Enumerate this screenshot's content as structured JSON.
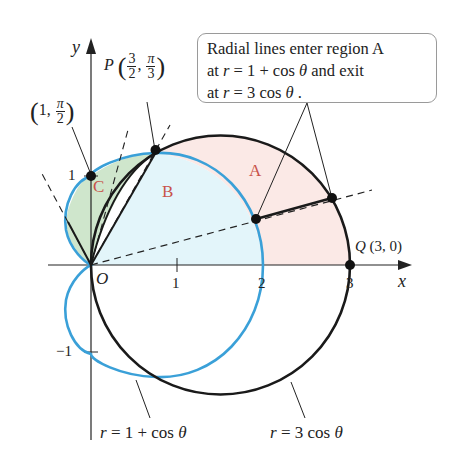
{
  "callout": {
    "line1": "Radial lines enter region A",
    "line2_pre": "at ",
    "line2_r": "r",
    "line2_eq": " = 1 + cos ",
    "line2_theta": "θ",
    "line2_post": " and exit",
    "line3_pre": "at ",
    "line3_r": "r",
    "line3_eq": " = 3 cos ",
    "line3_theta": "θ",
    "line3_post": " ."
  },
  "axes": {
    "x_label": "x",
    "y_label": "y",
    "origin_label": "O",
    "x_ticks": [
      "1",
      "2",
      "3"
    ],
    "y_ticks": [
      "1",
      "−1"
    ]
  },
  "points": {
    "P": {
      "name": "P",
      "r_num": "3",
      "r_den": "2",
      "theta_num": "π",
      "theta_den": "3"
    },
    "top": {
      "r": "1",
      "theta_num": "π",
      "theta_den": "2"
    },
    "Q": {
      "name": "Q",
      "coords": "(3, 0)"
    }
  },
  "regions": {
    "A": "A",
    "B": "B",
    "C": "C"
  },
  "curves": {
    "cardioid": {
      "label_r": "r",
      "label_eq": " = 1 + cos ",
      "label_theta": "θ",
      "color": "#3aa0d8"
    },
    "circle": {
      "label_r": "r",
      "label_eq": " = 3 cos ",
      "label_theta": "θ",
      "color": "#1a1a1a"
    }
  },
  "colors": {
    "region_A": "#fbe9e6",
    "region_B": "#e3f5fa",
    "region_C": "#cfe6cc",
    "region_label": "#c8524a"
  }
}
